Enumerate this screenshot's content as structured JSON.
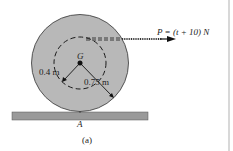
{
  "figure": {
    "caption": "(a)",
    "force_label": "P = (t + 10) N",
    "center_label": "G",
    "contact_label": "A",
    "inner_radius_label": "0.4 m",
    "outer_radius_label": "0.75 m"
  },
  "colors": {
    "wheel_fill": "#b8b8b8",
    "ground_fill": "#9a9a9a",
    "line": "#1a1a1a",
    "background": "#ffffff"
  }
}
